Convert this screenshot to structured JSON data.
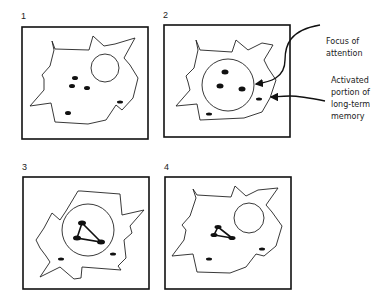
{
  "figure": {
    "panels": [
      {
        "number": "1",
        "description": "Long-term memory with several items; focus of attention empty"
      },
      {
        "number": "2",
        "description": "Items drawn into focus of attention"
      },
      {
        "number": "3",
        "description": "Items in focus linked together into a chunk"
      },
      {
        "number": "4",
        "description": "Linked chunk remains in activated long-term memory; focus empty"
      }
    ],
    "labels": {
      "focus": [
        "Focus of",
        "attention"
      ],
      "activated": [
        "Activated",
        "portion of",
        "long-term",
        "memory"
      ]
    },
    "colors": {
      "stroke": "#111111",
      "background": "#ffffff"
    }
  }
}
